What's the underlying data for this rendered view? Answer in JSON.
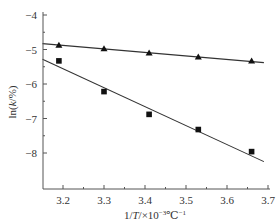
{
  "chart_data": {
    "type": "scatter",
    "title": "",
    "xlabel": "1/T/×10⁻³℃⁻¹",
    "ylabel": "ln(k/%)",
    "xlim": [
      3.15,
      3.7
    ],
    "ylim": [
      -8.8,
      -4.0
    ],
    "x_ticks": [
      3.2,
      3.3,
      3.4,
      3.5,
      3.6,
      3.7
    ],
    "x_tick_labels": [
      "3.2",
      "3.3",
      "3.4",
      "3.5",
      "3.6",
      "3.7"
    ],
    "x_minor_ticks": [
      3.25,
      3.35,
      3.45,
      3.55,
      3.65
    ],
    "y_ticks": [
      -4,
      -5,
      -6,
      -7,
      -8
    ],
    "y_tick_labels": [
      "−4",
      "−5",
      "−6",
      "−7",
      "−8"
    ],
    "y_minor_ticks": [
      -4.5,
      -5.5,
      -6.5,
      -7.5
    ],
    "grid": false,
    "legend": null,
    "series": [
      {
        "name": "triangle series",
        "marker": "triangle",
        "color": "#111111",
        "x": [
          3.19,
          3.3,
          3.41,
          3.53,
          3.66
        ],
        "y": [
          -4.88,
          -4.98,
          -5.1,
          -5.22,
          -5.33
        ],
        "fit_line": {
          "x": [
            3.15,
            3.69
          ],
          "y": [
            -4.83,
            -5.38
          ]
        }
      },
      {
        "name": "square series",
        "marker": "square",
        "color": "#111111",
        "x": [
          3.19,
          3.3,
          3.41,
          3.53,
          3.66
        ],
        "y": [
          -5.33,
          -6.22,
          -6.88,
          -7.32,
          -7.96
        ],
        "fit_line": {
          "x": [
            3.15,
            3.69
          ],
          "y": [
            -5.28,
            -8.25
          ]
        }
      }
    ]
  },
  "axis": {
    "ylabel_prefix": "ln(",
    "ylabel_var": "k",
    "ylabel_suffix": "/%)",
    "xlabel_prefix": "1/",
    "xlabel_var": "T",
    "xlabel_mid": "/×10",
    "xlabel_exp1": "−3",
    "xlabel_unit": "℃",
    "xlabel_exp2": "−1"
  },
  "colors": {
    "axis": "#555555",
    "ink": "#111111",
    "fit": "#333333"
  }
}
